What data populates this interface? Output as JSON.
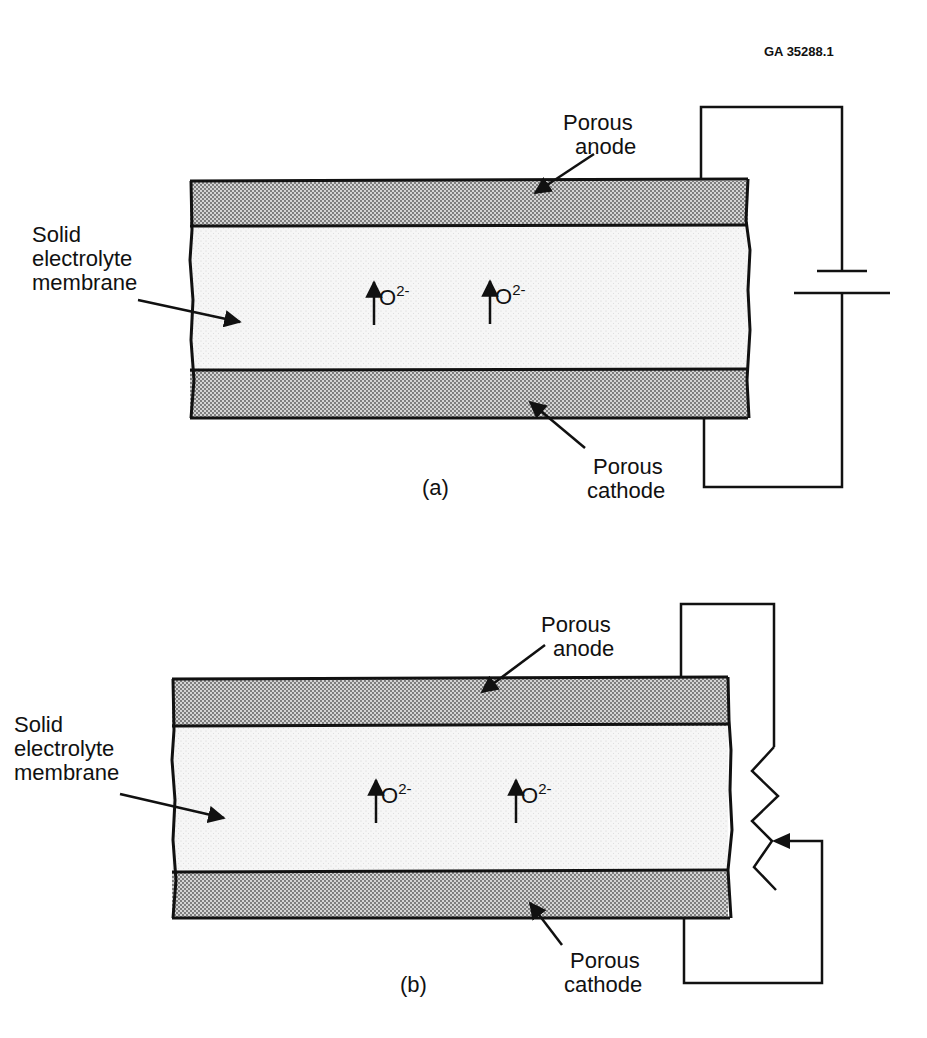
{
  "figure_id": "GA 35288.1",
  "panels": [
    {
      "caption": "(a)",
      "labels": {
        "anode": [
          "Porous",
          "anode"
        ],
        "cathode": [
          "Porous",
          "cathode"
        ],
        "membrane": [
          "Solid",
          "electrolyte",
          "membrane"
        ]
      },
      "ions": [
        {
          "symbol": "O",
          "charge": "2-"
        },
        {
          "symbol": "O",
          "charge": "2-"
        }
      ],
      "external_circuit": "battery"
    },
    {
      "caption": "(b)",
      "labels": {
        "anode": [
          "Porous",
          "anode"
        ],
        "cathode": [
          "Porous",
          "cathode"
        ],
        "membrane": [
          "Solid",
          "electrolyte",
          "membrane"
        ]
      },
      "ions": [
        {
          "symbol": "O",
          "charge": "2-"
        },
        {
          "symbol": "O",
          "charge": "2-"
        }
      ],
      "external_circuit": "variable-resistor"
    }
  ],
  "colors": {
    "electrode_fill": "#bdbdbd",
    "membrane_fill": "#f1f1f1",
    "line": "#111111"
  }
}
